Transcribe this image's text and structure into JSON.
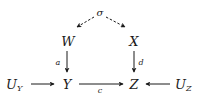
{
  "diagram": {
    "type": "causal-graph",
    "nodes": {
      "sigma": {
        "label": "σ",
        "x": 100,
        "y": 14
      },
      "W": {
        "label": "W",
        "x": 68,
        "y": 46
      },
      "X": {
        "label": "X",
        "x": 134,
        "y": 46
      },
      "Y": {
        "label": "Y",
        "x": 67,
        "y": 89
      },
      "Z": {
        "label": "Z",
        "x": 134,
        "y": 89
      },
      "UY": {
        "label": "U",
        "sub": "Y",
        "x": 9,
        "y": 89
      },
      "UZ": {
        "label": "U",
        "sub": "Z",
        "x": 178,
        "y": 89
      }
    },
    "edges": [
      {
        "from": "sigma",
        "to": "W",
        "style": "dashed",
        "label": ""
      },
      {
        "from": "sigma",
        "to": "X",
        "style": "dashed",
        "label": ""
      },
      {
        "from": "W",
        "to": "Y",
        "style": "solid",
        "label": "a"
      },
      {
        "from": "X",
        "to": "Z",
        "style": "solid",
        "label": "d"
      },
      {
        "from": "Y",
        "to": "Z",
        "style": "solid",
        "label": "c"
      },
      {
        "from": "UY",
        "to": "Y",
        "style": "solid",
        "label": ""
      },
      {
        "from": "UZ",
        "to": "Z",
        "style": "solid",
        "label": ""
      }
    ],
    "edge_labels": {
      "a": "a",
      "c": "c",
      "d": "d"
    }
  }
}
